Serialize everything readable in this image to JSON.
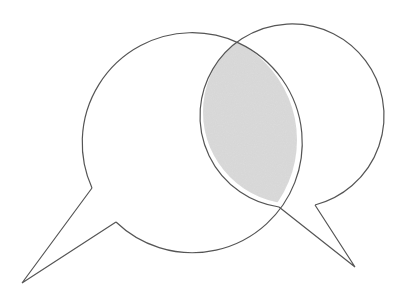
{
  "diagram": {
    "title": "Two overlapping speech bubbles",
    "colors": {
      "stroke": "#555555",
      "fill": "#ffffff",
      "overlap_fill": "#d4d4d4",
      "background": "#ffffff"
    },
    "shapes": [
      {
        "name": "left-speech-bubble",
        "circle": {
          "cx": 187,
          "cy": 140,
          "r": 110
        },
        "tail": {
          "from": [
            92,
            188
          ],
          "tip": [
            22,
            283
          ],
          "to": [
            116,
            222
          ]
        }
      },
      {
        "name": "right-speech-bubble",
        "circle": {
          "cx": 295,
          "cy": 112,
          "r": 92
        },
        "tail": {
          "from": [
            279,
            207
          ],
          "tip": [
            355,
            267
          ],
          "to": [
            315,
            205
          ]
        }
      }
    ],
    "overlap": {
      "name": "intersection-region",
      "shaded": true
    }
  }
}
